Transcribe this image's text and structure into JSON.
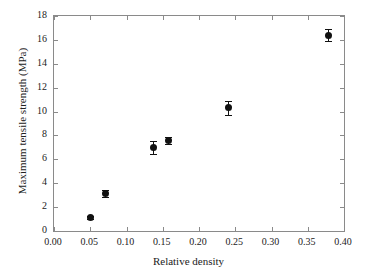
{
  "chart_data": {
    "type": "scatter",
    "title": "",
    "xlabel": "Relative density",
    "ylabel": "Maximum tensile strength (MPa)",
    "xlim": [
      0.0,
      0.4
    ],
    "ylim": [
      0,
      18
    ],
    "grid": false,
    "legend": null,
    "xticks": [
      0.0,
      0.05,
      0.1,
      0.15,
      0.2,
      0.25,
      0.3,
      0.35,
      0.4
    ],
    "xticklabels": [
      "0.00",
      "0.05",
      "0.10",
      "0.15",
      "0.20",
      "0.25",
      "0.30",
      "0.35",
      "0.40"
    ],
    "yticks": [
      0,
      2,
      4,
      6,
      8,
      10,
      12,
      14,
      16,
      18
    ],
    "yticklabels": [
      "0",
      "2",
      "4",
      "6",
      "8",
      "10",
      "12",
      "14",
      "16",
      "18"
    ],
    "marker": "filled-circle",
    "marker_color": "#111111",
    "frame_color": "#8a8a8a",
    "background": "#ffffff",
    "x": [
      0.05,
      0.071,
      0.137,
      0.158,
      0.241,
      0.379
    ],
    "y": [
      1.15,
      3.15,
      7.0,
      7.55,
      10.3,
      16.4
    ],
    "yerr": [
      0.12,
      0.28,
      0.55,
      0.3,
      0.55,
      0.5
    ],
    "points": [
      {
        "x": 0.05,
        "y": 1.15,
        "yerr": 0.12
      },
      {
        "x": 0.071,
        "y": 3.15,
        "yerr": 0.28
      },
      {
        "x": 0.137,
        "y": 7.0,
        "yerr": 0.55
      },
      {
        "x": 0.158,
        "y": 7.55,
        "yerr": 0.3
      },
      {
        "x": 0.241,
        "y": 10.3,
        "yerr": 0.55
      },
      {
        "x": 0.379,
        "y": 16.4,
        "yerr": 0.5
      }
    ]
  }
}
